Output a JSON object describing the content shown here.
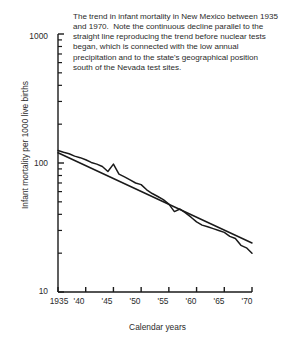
{
  "caption": "The trend in infant mortality in New Mexico between 1935 and 1970.  Note the continuous decline parallel to the straight line reproducing the trend before nuclear tests began, which is connected with the low annual precipitation and to the state's geographical position south of the Nevada test sites.",
  "chart_data": {
    "type": "line",
    "title": "",
    "xlabel": "Calendar years",
    "ylabel": "Infant mortality per 1000 live births",
    "xlim": [
      1935,
      1970
    ],
    "ylim": [
      10,
      1000
    ],
    "yscale": "log",
    "grid": false,
    "legend": "none",
    "x_tick_labels": [
      "1935",
      "'40",
      "'45",
      "'50",
      "'55",
      "'60",
      "'65",
      "'70"
    ],
    "x_tick_values": [
      1935,
      1940,
      1945,
      1950,
      1955,
      1960,
      1965,
      1970
    ],
    "y_tick_labels": [
      "1000",
      "100",
      "10"
    ],
    "y_tick_values": [
      1000,
      100,
      10
    ],
    "y_minor_ticks": [
      20,
      30,
      40,
      50,
      60,
      70,
      80,
      90,
      200,
      300,
      400,
      500,
      600,
      700,
      800,
      900
    ],
    "series": [
      {
        "name": "Observed infant mortality",
        "style": "jagged-line",
        "x": [
          1935,
          1936,
          1937,
          1938,
          1939,
          1940,
          1941,
          1942,
          1943,
          1944,
          1945,
          1946,
          1947,
          1948,
          1949,
          1950,
          1951,
          1952,
          1953,
          1954,
          1955,
          1956,
          1957,
          1958,
          1959,
          1960,
          1961,
          1962,
          1963,
          1964,
          1965,
          1966,
          1967,
          1968,
          1969,
          1970
        ],
        "values": [
          125,
          121,
          118,
          113,
          110,
          106,
          101,
          98,
          94,
          86,
          98,
          82,
          78,
          74,
          70,
          68,
          62,
          58,
          55,
          52,
          48,
          42,
          44,
          41,
          38,
          35,
          33,
          32,
          31,
          30,
          29,
          27,
          26,
          23,
          22,
          20
        ]
      },
      {
        "name": "Pre-test trend line",
        "style": "straight-line",
        "x": [
          1935,
          1970
        ],
        "values": [
          120,
          24
        ]
      }
    ],
    "annotations": [
      {
        "label": "peak",
        "x": 1945,
        "value": 98
      }
    ]
  },
  "ticks": {
    "y": [
      {
        "label": "1000",
        "left": 10,
        "top": 31,
        "width": 38
      },
      {
        "label": "100",
        "left": 10,
        "top": 158,
        "width": 38
      },
      {
        "label": "10",
        "left": 10,
        "top": 286,
        "width": 38
      }
    ],
    "x": [
      {
        "label": "1935",
        "left": 43,
        "top": 296,
        "width": 32
      },
      {
        "label": "'40",
        "left": 63,
        "top": 296,
        "width": 32
      },
      {
        "label": "'45",
        "left": 91,
        "top": 296,
        "width": 32
      },
      {
        "label": "'50",
        "left": 119,
        "top": 296,
        "width": 32
      },
      {
        "label": "'55",
        "left": 147,
        "top": 296,
        "width": 32
      },
      {
        "label": "'60",
        "left": 175,
        "top": 296,
        "width": 32
      },
      {
        "label": "'65",
        "left": 203,
        "top": 296,
        "width": 32
      },
      {
        "label": "'70",
        "left": 231,
        "top": 296,
        "width": 32
      }
    ]
  },
  "colors": {
    "ink": "#1a1a1a",
    "text": "#2b2b2b",
    "background": "#ffffff"
  }
}
